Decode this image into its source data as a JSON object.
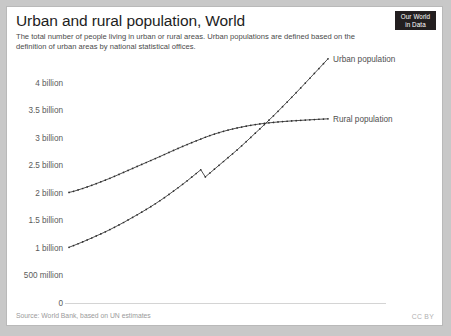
{
  "header": {
    "title": "Urban and rural population, World",
    "subtitle": "The total number of people living in urban or rural areas. Urban populations are defined based on the definition of urban areas by national statistical offices.",
    "logo_line1": "Our World",
    "logo_line2": "in Data"
  },
  "footer": {
    "source": "Source: World Bank, based on UN estimates",
    "license": "CC BY"
  },
  "colors": {
    "line": "#3c3c3c",
    "axis": "#d4d4d4",
    "tick_text": "#5b5b5b",
    "logo_background": "#231f20",
    "card_background": "#ffffff",
    "page_background": "#c8c8c8"
  },
  "chart_data": {
    "type": "line",
    "title": "Urban and rural population, World",
    "subtitle": "The total number of people living in urban or rural areas. Urban populations are defined based on the definition of urban areas by national statistical offices.",
    "xlabel": "",
    "ylabel": "",
    "xlim": [
      1960,
      2017
    ],
    "ylim": [
      0,
      4250000000
    ],
    "grid": false,
    "legend_position": "right-of-line-end",
    "ytick_labels": [
      "0",
      "500 million",
      "1 billion",
      "1.5 billion",
      "2 billion",
      "2.5 billion",
      "3 billion",
      "3.5 billion",
      "4 billion"
    ],
    "ytick_values": [
      0,
      500000000,
      1000000000,
      1500000000,
      2000000000,
      2500000000,
      3000000000,
      3500000000,
      4000000000
    ],
    "xtick_labels": [
      "1960",
      "1970",
      "1980",
      "1990",
      "2000",
      "2010",
      "2017"
    ],
    "xtick_values": [
      1960,
      1970,
      1980,
      1990,
      2000,
      2010,
      2017
    ],
    "x": [
      1960,
      1961,
      1962,
      1963,
      1964,
      1965,
      1966,
      1967,
      1968,
      1969,
      1970,
      1971,
      1972,
      1973,
      1974,
      1975,
      1976,
      1977,
      1978,
      1979,
      1980,
      1981,
      1982,
      1983,
      1984,
      1985,
      1986,
      1987,
      1988,
      1989,
      1990,
      1991,
      1992,
      1993,
      1994,
      1995,
      1996,
      1997,
      1998,
      1999,
      2000,
      2001,
      2002,
      2003,
      2004,
      2005,
      2006,
      2007,
      2008,
      2009,
      2010,
      2011,
      2012,
      2013,
      2014,
      2015,
      2016,
      2017
    ],
    "series": [
      {
        "name": "Urban population",
        "label": "Urban population",
        "color": "#3c3c3c",
        "values": [
          1012000000,
          1043000000,
          1076000000,
          1110000000,
          1145000000,
          1181000000,
          1218000000,
          1255000000,
          1293000000,
          1333000000,
          1375000000,
          1418000000,
          1462000000,
          1508000000,
          1555000000,
          1602000000,
          1650000000,
          1699000000,
          1750000000,
          1803000000,
          1857000000,
          1913000000,
          1972000000,
          2032000000,
          2093000000,
          2155000000,
          2219000000,
          2285000000,
          2352000000,
          2420000000,
          2290000000,
          2360000000,
          2430000000,
          2500000000,
          2570000000,
          2640000000,
          2710000000,
          2780000000,
          2855000000,
          2930000000,
          3008000000,
          3085000000,
          3162000000,
          3240000000,
          3320000000,
          3400000000,
          3482000000,
          3566000000,
          3650000000,
          3735000000,
          3820000000,
          3907000000,
          3994000000,
          4082000000,
          4170000000,
          4258000000,
          4346000000,
          4435000000
        ]
      },
      {
        "name": "Rural population",
        "label": "Rural population",
        "color": "#3c3c3c",
        "values": [
          2008000000,
          2028000000,
          2053000000,
          2080000000,
          2108000000,
          2137000000,
          2168000000,
          2200000000,
          2232000000,
          2265000000,
          2300000000,
          2336000000,
          2372000000,
          2408000000,
          2444000000,
          2480000000,
          2516000000,
          2552000000,
          2588000000,
          2624000000,
          2660000000,
          2697000000,
          2734000000,
          2771000000,
          2807000000,
          2843000000,
          2878000000,
          2912000000,
          2945000000,
          2977000000,
          3010000000,
          3040000000,
          3068000000,
          3094000000,
          3118000000,
          3140000000,
          3160000000,
          3179000000,
          3196000000,
          3212000000,
          3227000000,
          3240000000,
          3252000000,
          3263000000,
          3272000000,
          3280000000,
          3288000000,
          3295000000,
          3301000000,
          3307000000,
          3312000000,
          3317000000,
          3322000000,
          3327000000,
          3332000000,
          3337000000,
          3341000000,
          3345000000
        ]
      }
    ],
    "annotations": [
      {
        "text": "Crossover: urban exceeds rural",
        "year": 2007,
        "value": 3300000000
      }
    ]
  }
}
